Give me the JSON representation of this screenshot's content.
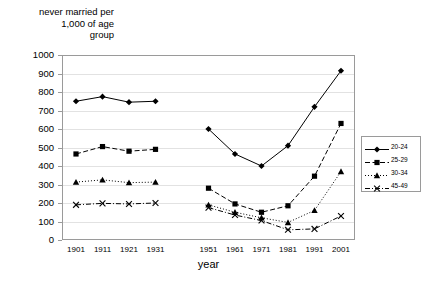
{
  "chart_data": {
    "type": "line",
    "title": "never married per\n1,000 of age\ngroup",
    "ylabel": "never married per 1,000 of age group",
    "xlabel": "year",
    "ylim": [
      0,
      1000
    ],
    "ytick_step": 100,
    "yticks": [
      "1000",
      "900",
      "800",
      "700",
      "600",
      "500",
      "400",
      "300",
      "200",
      "100",
      "0"
    ],
    "categories": [
      "1901",
      "1911",
      "1921",
      "1931",
      "",
      "1951",
      "1961",
      "1971",
      "1981",
      "1991",
      "2001"
    ],
    "grid": "horizontal",
    "legend_position": "right",
    "series": [
      {
        "name": "20-24",
        "marker": "diamond",
        "dash": "solid",
        "color": "#000000",
        "values": [
          750,
          775,
          745,
          750,
          null,
          600,
          465,
          400,
          510,
          720,
          915
        ]
      },
      {
        "name": "25-29",
        "marker": "square",
        "dash": "dashed",
        "color": "#000000",
        "values": [
          465,
          505,
          480,
          490,
          null,
          280,
          195,
          150,
          185,
          345,
          630
        ]
      },
      {
        "name": "30-34",
        "marker": "triangle",
        "dash": "dotted",
        "color": "#000000",
        "values": [
          313,
          325,
          310,
          313,
          null,
          190,
          150,
          120,
          95,
          160,
          370
        ]
      },
      {
        "name": "45-49",
        "marker": "cross",
        "dash": "dashdot",
        "color": "#000000",
        "values": [
          190,
          198,
          195,
          200,
          null,
          175,
          135,
          105,
          55,
          60,
          130
        ]
      }
    ]
  },
  "legend": {
    "items": [
      {
        "label": "20-24"
      },
      {
        "label": "25-29"
      },
      {
        "label": "30-34"
      },
      {
        "label": "45-49"
      }
    ]
  }
}
